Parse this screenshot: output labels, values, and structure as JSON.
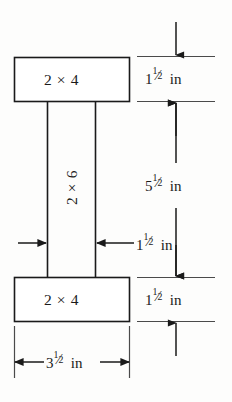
{
  "figure": {
    "background_color": "#fdfdfc",
    "line_color": "#1a1a1a",
    "text_color": "#1a1a1a"
  },
  "members": {
    "top_flange": {
      "label": "2 × 4",
      "nominal": "2 × 4",
      "x": 14,
      "y": 57,
      "width": 116,
      "height": 45
    },
    "web": {
      "label": "2 × 6",
      "nominal": "2 × 6",
      "orientation": "vertical",
      "rotation_degrees": -90,
      "left_x": 47,
      "right_x": 95,
      "top_y": 102,
      "bottom_y": 277
    },
    "bottom_flange": {
      "label": "2 × 4",
      "nominal": "2 × 4",
      "x": 14,
      "y": 277,
      "width": 116,
      "height": 45
    }
  },
  "dimensions": {
    "top_flange_thickness": {
      "whole": "1",
      "numerator": "1",
      "slash": "⁄",
      "denominator": "2",
      "unit": "in",
      "full_text": "1 1/2 in",
      "arrow_style": "inward",
      "orientation": "vertical"
    },
    "web_depth": {
      "whole": "5",
      "numerator": "1",
      "slash": "⁄",
      "denominator": "2",
      "unit": "in",
      "full_text": "5 1/2 in",
      "arrow_style": "double-headed",
      "orientation": "vertical"
    },
    "bottom_flange_thickness": {
      "whole": "1",
      "numerator": "1",
      "slash": "⁄",
      "denominator": "2",
      "unit": "in",
      "full_text": "1 1/2 in",
      "arrow_style": "inward",
      "orientation": "vertical"
    },
    "web_width": {
      "whole": "1",
      "numerator": "1",
      "slash": "⁄",
      "denominator": "2",
      "unit": "in",
      "full_text": "1 1/2 in",
      "arrow_style": "inward-with-leader",
      "orientation": "horizontal"
    },
    "overall_width": {
      "whole": "3",
      "numerator": "1",
      "slash": "⁄",
      "denominator": "2",
      "unit": "in",
      "full_text": "3 1/2 in",
      "arrow_style": "outward",
      "orientation": "horizontal"
    }
  }
}
